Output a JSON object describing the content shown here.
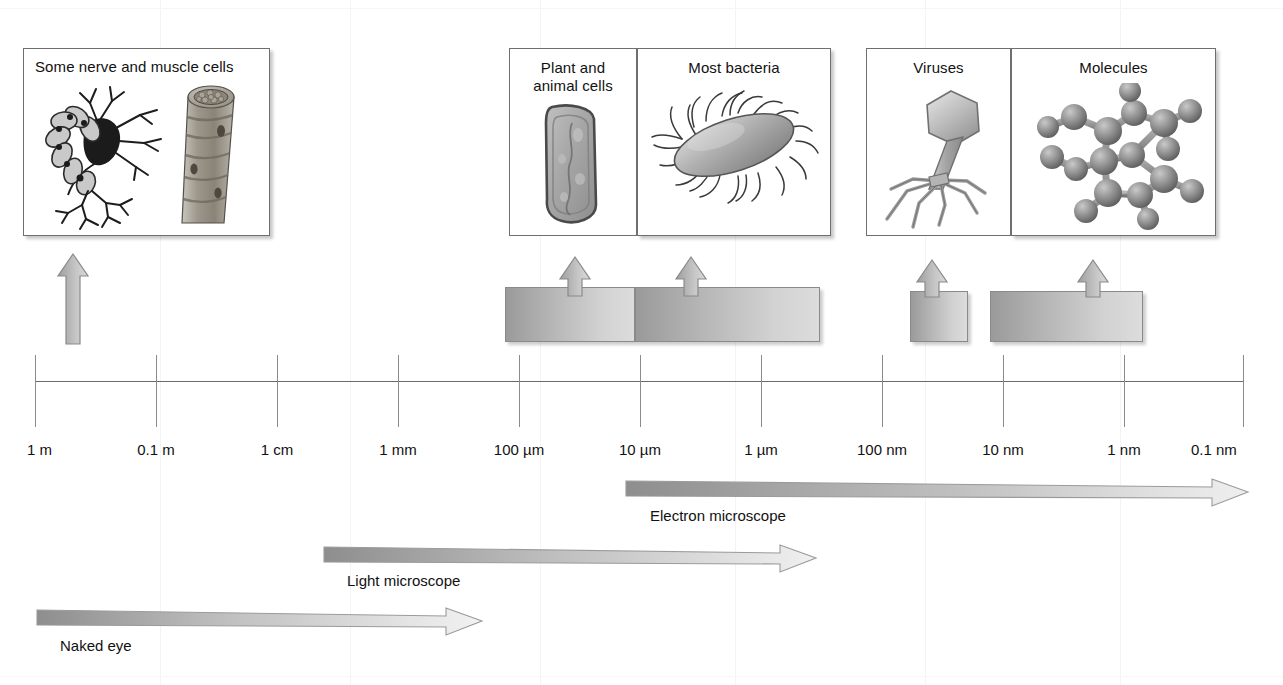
{
  "figure": {
    "type": "scale-diagram"
  },
  "axis": {
    "name": "logarithmic size scale",
    "ticks": [
      {
        "label": "1 m",
        "value_m": 1,
        "x": 35
      },
      {
        "label": "0.1 m",
        "value_m": 0.1,
        "x": 156
      },
      {
        "label": "1 cm",
        "value_m": 0.01,
        "x": 277
      },
      {
        "label": "1 mm",
        "value_m": 0.001,
        "x": 398
      },
      {
        "label": "100 µm",
        "value_m": 0.0001,
        "x": 519
      },
      {
        "label": "10 µm",
        "value_m": 1e-05,
        "x": 640
      },
      {
        "label": "1 µm",
        "value_m": 1e-06,
        "x": 761
      },
      {
        "label": "100 nm",
        "value_m": 1e-07,
        "x": 882
      },
      {
        "label": "10 nm",
        "value_m": 1e-08,
        "x": 1003
      },
      {
        "label": "1 nm",
        "value_m": 1e-09,
        "x": 1124
      },
      {
        "label": "0.1 nm",
        "value_m": 1e-10,
        "x": 1243
      }
    ]
  },
  "panels": [
    {
      "id": "nerve-muscle",
      "caption": "Some nerve and muscle cells",
      "caption_lines": [
        "Some nerve and muscle cells"
      ],
      "artwork": "neuron-and-muscle-fibre",
      "box": {
        "x": 23,
        "y": 48,
        "w": 247,
        "h": 188
      },
      "caption_centered": false
    },
    {
      "id": "plant-animal-cells",
      "caption": "Plant and animal cells",
      "caption_lines": [
        "Plant and",
        "animal cells"
      ],
      "artwork": "generic-cell",
      "box": {
        "x": 509,
        "y": 48,
        "w": 128,
        "h": 188
      }
    },
    {
      "id": "most-bacteria",
      "caption": "Most bacteria",
      "caption_lines": [
        "Most bacteria"
      ],
      "artwork": "flagellated-bacterium",
      "box": {
        "x": 637,
        "y": 48,
        "w": 194,
        "h": 188
      }
    },
    {
      "id": "viruses",
      "caption": "Viruses",
      "caption_lines": [
        "Viruses"
      ],
      "artwork": "bacteriophage",
      "box": {
        "x": 866,
        "y": 48,
        "w": 145,
        "h": 188
      }
    },
    {
      "id": "molecules",
      "caption": "Molecules",
      "caption_lines": [
        "Molecules"
      ],
      "artwork": "ball-and-stick-molecule",
      "box": {
        "x": 1011,
        "y": 48,
        "w": 205,
        "h": 188
      }
    }
  ],
  "range_bars": [
    {
      "id": "nerve-muscle-pointer",
      "panel": "nerve-muscle",
      "bar": null,
      "arrow_x": 72,
      "arrow_top": 252,
      "arrow_height": 92,
      "bar_only_arrow": true
    },
    {
      "id": "plant-animal-range",
      "panel": "plant-animal-cells",
      "x": 505,
      "w": 130,
      "y": 287,
      "h": 55,
      "arrow_x": 574,
      "arrow_top": 255,
      "arrow_height": 40
    },
    {
      "id": "bacteria-range",
      "panel": "most-bacteria",
      "x": 635,
      "w": 185,
      "y": 287,
      "h": 55,
      "arrow_x": 690,
      "arrow_top": 255,
      "arrow_height": 40
    },
    {
      "id": "viruses-range",
      "panel": "viruses",
      "x": 910,
      "w": 58,
      "y": 291,
      "h": 51,
      "arrow_x": 931,
      "arrow_top": 258,
      "arrow_height": 38
    },
    {
      "id": "molecules-range",
      "panel": "molecules",
      "x": 990,
      "w": 153,
      "y": 291,
      "h": 51,
      "arrow_x": 1092,
      "arrow_top": 258,
      "arrow_height": 38
    }
  ],
  "methods": [
    {
      "id": "electron-microscope",
      "label": "Electron microscope",
      "from_tick": "10 µm",
      "to_tick": "0.1 nm",
      "x": 624,
      "y": 477,
      "w": 626,
      "thickness": 17,
      "label_x": 650,
      "label_y": 507
    },
    {
      "id": "light-microscope",
      "label": "Light microscope",
      "from_tick": "1 mm",
      "to_tick": "100 nm",
      "x": 322,
      "y": 543,
      "w": 495,
      "thickness": 17,
      "label_x": 347,
      "label_y": 572
    },
    {
      "id": "naked-eye",
      "label": "Naked eye",
      "from_tick": "1 m",
      "to_tick": "100 µm",
      "x": 35,
      "y": 606,
      "w": 448,
      "thickness": 17,
      "label_x": 60,
      "label_y": 637
    }
  ],
  "colors": {
    "axis": "#6b6b6b",
    "tick": "#8b8b8b",
    "panel_border": "#6f6f6f",
    "bar_dark": "#9a9a9a",
    "bar_light": "#dcdcdc",
    "text": "#111111"
  }
}
